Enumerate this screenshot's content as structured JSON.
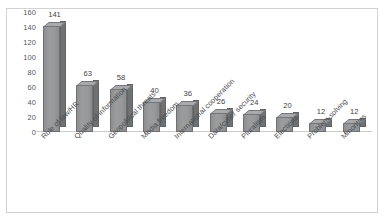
{
  "chart_data": {
    "type": "bar",
    "title": "",
    "subtitle": "",
    "xlabel": "",
    "ylabel": "",
    "ylim": [
      0,
      160
    ],
    "ytick_step": 20,
    "yticks": [
      "160",
      "140",
      "120",
      "100",
      "80",
      "60",
      "40",
      "20",
      "0"
    ],
    "grid": false,
    "legend": false,
    "legend_position": "none",
    "style": "3d-column",
    "bar_color": "#949698",
    "bar_side_color": "#6f7173",
    "bar_top_color": "#a8aaac",
    "label_color": "#3f4245",
    "frame_color": "#d2d2d2",
    "categories": [
      "Rule of law/HR",
      "Quality of information",
      "Geopolitical threats",
      "Media freedom",
      "International cooperation",
      "Data/cyber security",
      "Pluralism",
      "Elections",
      "Problem-solving",
      "Minorities"
    ],
    "values": [
      141,
      63,
      58,
      40,
      36,
      26,
      24,
      20,
      12,
      12
    ],
    "value_labels": [
      "141",
      "63",
      "58",
      "40",
      "36",
      "26",
      "24",
      "20",
      "12",
      "12"
    ]
  }
}
